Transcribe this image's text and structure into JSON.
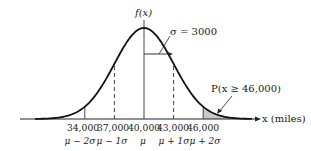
{
  "diagram": {
    "y_axis_label": "f(x)",
    "x_axis_label": "x (miles)",
    "sigma_label": "σ = 3000",
    "probability_label": "P(x ≥ 46,000)",
    "colors": {
      "curve": "#111111",
      "shaded_region": "#c8c8c8",
      "lines": "#333333"
    },
    "ticks": [
      {
        "value": "34,000",
        "symbol": "μ − 2σ",
        "line": "solid"
      },
      {
        "value": "37,000",
        "symbol": "μ − 1σ",
        "line": "dashed"
      },
      {
        "value": "40,000",
        "symbol": "μ",
        "line": "solid"
      },
      {
        "value": "43,000",
        "symbol": "μ + 1σ",
        "line": "dashed"
      },
      {
        "value": "46,000",
        "symbol": "μ + 2σ",
        "line": "solid"
      }
    ]
  },
  "chart_data": {
    "type": "area",
    "xlabel": "x (miles)",
    "ylabel": "f(x)",
    "mean": 40000,
    "std_dev": 3000,
    "x_ticks": [
      34000,
      37000,
      40000,
      43000,
      46000
    ],
    "x_tick_symbols": [
      "μ−2σ",
      "μ−1σ",
      "μ",
      "μ+1σ",
      "μ+2σ"
    ],
    "shaded_region": {
      "from": 46000,
      "to": "∞",
      "label": "P(x ≥ 46,000)"
    },
    "annotations": [
      "σ = 3000",
      "P(x ≥ 46,000)"
    ]
  }
}
